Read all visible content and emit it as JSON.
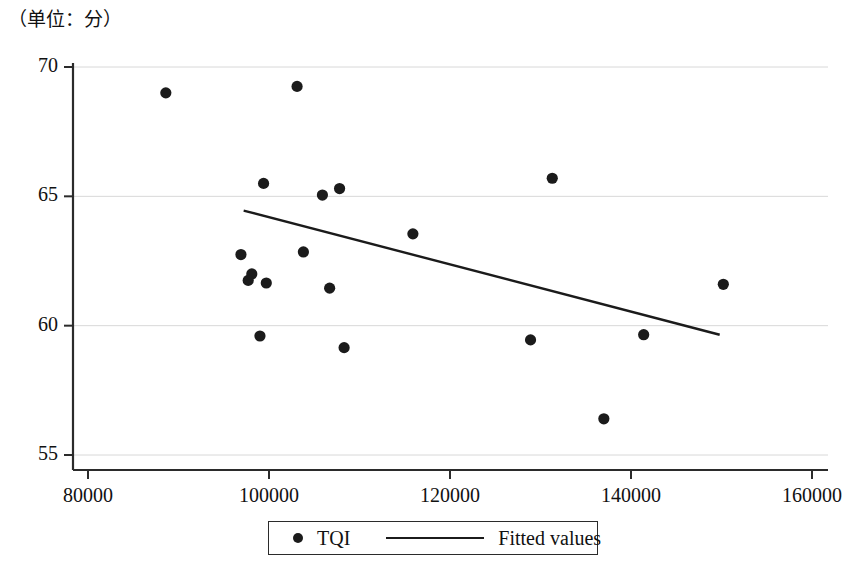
{
  "chart_data": {
    "type": "scatter",
    "title": "（单位：分）",
    "xlabel": "",
    "ylabel": "",
    "xlim": [
      76000,
      162000
    ],
    "ylim": [
      54.3,
      70.6
    ],
    "xticks": [
      80000,
      100000,
      120000,
      140000,
      160000
    ],
    "xtick_labels": [
      "80000",
      "100000",
      "120000",
      "140000",
      "160000"
    ],
    "yticks": [
      55,
      60,
      65,
      70
    ],
    "ytick_labels": [
      "55",
      "60",
      "65",
      "70"
    ],
    "grid": "horizontal",
    "legend_position": "bottom",
    "series": [
      {
        "name": "TQI",
        "type": "scatter",
        "marker": "circle",
        "color": "#1b1b1b",
        "points": [
          {
            "x": 88600,
            "y": 69.0
          },
          {
            "x": 103100,
            "y": 69.25
          },
          {
            "x": 99400,
            "y": 65.5
          },
          {
            "x": 105900,
            "y": 65.05
          },
          {
            "x": 107800,
            "y": 65.3
          },
          {
            "x": 131300,
            "y": 65.7
          },
          {
            "x": 115900,
            "y": 63.55
          },
          {
            "x": 96900,
            "y": 62.75
          },
          {
            "x": 103800,
            "y": 62.85
          },
          {
            "x": 98100,
            "y": 62.0
          },
          {
            "x": 97700,
            "y": 61.75
          },
          {
            "x": 99700,
            "y": 61.65
          },
          {
            "x": 106700,
            "y": 61.45
          },
          {
            "x": 150200,
            "y": 61.6
          },
          {
            "x": 99000,
            "y": 59.6
          },
          {
            "x": 108300,
            "y": 59.15
          },
          {
            "x": 128900,
            "y": 59.45
          },
          {
            "x": 141400,
            "y": 59.65
          },
          {
            "x": 137000,
            "y": 56.4
          }
        ]
      },
      {
        "name": "Fitted values",
        "type": "line",
        "color": "#1b1b1b",
        "points": [
          {
            "x": 97200,
            "y": 64.45
          },
          {
            "x": 149800,
            "y": 59.65
          }
        ]
      }
    ],
    "legend": [
      {
        "label": "TQI",
        "marker": "dot"
      },
      {
        "label": "Fitted values",
        "marker": "line"
      }
    ]
  }
}
